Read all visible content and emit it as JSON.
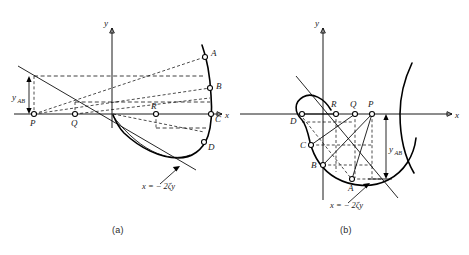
{
  "figure": {
    "type": "technical-diagram",
    "panels": [
      {
        "id": "a",
        "caption": "(a)",
        "axes": {
          "x_label": "x",
          "y_label": "y",
          "origin_x": 112,
          "origin_y": 114
        },
        "equation_label": "x = − 2ζy",
        "dimension_label": "y",
        "dimension_sub": "AB",
        "curve_points": [
          {
            "name": "A",
            "label": "A",
            "x": 205,
            "y": 57
          },
          {
            "name": "B",
            "label": "B",
            "x": 210,
            "y": 88
          },
          {
            "name": "C",
            "label": "C",
            "x": 211,
            "y": 114
          },
          {
            "name": "D",
            "label": "D",
            "x": 204,
            "y": 142
          }
        ],
        "axis_points": [
          {
            "name": "P",
            "label": "P",
            "x": 34,
            "y": 114
          },
          {
            "name": "Q",
            "label": "Q",
            "x": 75,
            "y": 114
          },
          {
            "name": "R",
            "label": "R",
            "x": 156,
            "y": 114
          }
        ]
      },
      {
        "id": "b",
        "caption": "(b)",
        "axes": {
          "x_label": "x",
          "y_label": "y",
          "origin_x": 323,
          "origin_y": 114
        },
        "equation_label": "x = − 2ζy",
        "dimension_label": "y",
        "dimension_sub": "AB",
        "curve_points": [
          {
            "name": "D",
            "label": "D",
            "x": 302,
            "y": 114
          },
          {
            "name": "C",
            "label": "C",
            "x": 311,
            "y": 145
          },
          {
            "name": "B",
            "label": "B",
            "x": 323,
            "y": 165
          },
          {
            "name": "A",
            "label": "A",
            "x": 352,
            "y": 179
          }
        ],
        "axis_points": [
          {
            "name": "R",
            "label": "R",
            "x": 336,
            "y": 114
          },
          {
            "name": "Q",
            "label": "Q",
            "x": 355,
            "y": 114
          },
          {
            "name": "P",
            "label": "P",
            "x": 372,
            "y": 114
          }
        ]
      }
    ]
  },
  "colors": {
    "ink": "#1a1a1a",
    "background": "#ffffff"
  }
}
